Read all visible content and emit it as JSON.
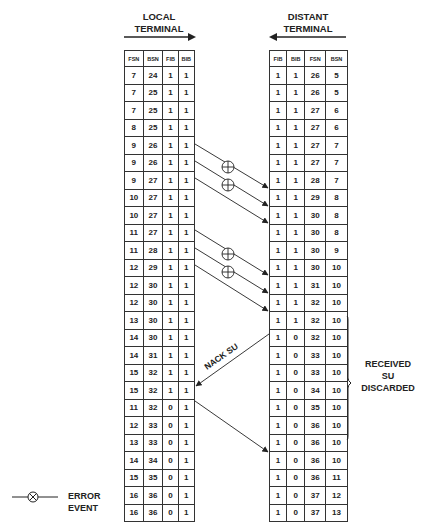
{
  "local_terminal": {
    "title_line1": "LOCAL",
    "title_line2": "TERMINAL",
    "columns": [
      "FSN",
      "BSN",
      "FIB",
      "BIB"
    ],
    "rows": [
      [
        "7",
        "24",
        "1",
        "1"
      ],
      [
        "7",
        "25",
        "1",
        "1"
      ],
      [
        "7",
        "25",
        "1",
        "1"
      ],
      [
        "8",
        "25",
        "1",
        "1"
      ],
      [
        "9",
        "26",
        "1",
        "1"
      ],
      [
        "9",
        "26",
        "1",
        "1"
      ],
      [
        "9",
        "27",
        "1",
        "1"
      ],
      [
        "10",
        "27",
        "1",
        "1"
      ],
      [
        "10",
        "27",
        "1",
        "1"
      ],
      [
        "11",
        "27",
        "1",
        "1"
      ],
      [
        "11",
        "28",
        "1",
        "1"
      ],
      [
        "12",
        "29",
        "1",
        "1"
      ],
      [
        "12",
        "30",
        "1",
        "1"
      ],
      [
        "12",
        "30",
        "1",
        "1"
      ],
      [
        "13",
        "30",
        "1",
        "1"
      ],
      [
        "14",
        "30",
        "1",
        "1"
      ],
      [
        "14",
        "31",
        "1",
        "1"
      ],
      [
        "15",
        "32",
        "1",
        "1"
      ],
      [
        "15",
        "32",
        "1",
        "1"
      ],
      [
        "11",
        "32",
        "0",
        "1"
      ],
      [
        "12",
        "33",
        "0",
        "1"
      ],
      [
        "13",
        "33",
        "0",
        "1"
      ],
      [
        "14",
        "34",
        "0",
        "1"
      ],
      [
        "15",
        "35",
        "0",
        "1"
      ],
      [
        "16",
        "36",
        "0",
        "1"
      ],
      [
        "16",
        "36",
        "0",
        "1"
      ]
    ]
  },
  "distant_terminal": {
    "title_line1": "DISTANT",
    "title_line2": "TERMINAL",
    "columns": [
      "FIB",
      "BIB",
      "FSN",
      "BSN"
    ],
    "rows": [
      [
        "1",
        "1",
        "26",
        "5"
      ],
      [
        "1",
        "1",
        "26",
        "5"
      ],
      [
        "1",
        "1",
        "27",
        "6"
      ],
      [
        "1",
        "1",
        "27",
        "6"
      ],
      [
        "1",
        "1",
        "27",
        "7"
      ],
      [
        "1",
        "1",
        "27",
        "7"
      ],
      [
        "1",
        "1",
        "28",
        "7"
      ],
      [
        "1",
        "1",
        "29",
        "8"
      ],
      [
        "1",
        "1",
        "30",
        "8"
      ],
      [
        "1",
        "1",
        "30",
        "8"
      ],
      [
        "1",
        "1",
        "30",
        "9"
      ],
      [
        "1",
        "1",
        "30",
        "10"
      ],
      [
        "1",
        "1",
        "31",
        "10"
      ],
      [
        "1",
        "1",
        "32",
        "10"
      ],
      [
        "1",
        "1",
        "32",
        "10"
      ],
      [
        "1",
        "0",
        "32",
        "10"
      ],
      [
        "1",
        "0",
        "33",
        "10"
      ],
      [
        "1",
        "0",
        "33",
        "10"
      ],
      [
        "1",
        "0",
        "34",
        "10"
      ],
      [
        "1",
        "0",
        "35",
        "10"
      ],
      [
        "1",
        "0",
        "36",
        "10"
      ],
      [
        "1",
        "0",
        "36",
        "10"
      ],
      [
        "1",
        "0",
        "36",
        "10"
      ],
      [
        "1",
        "0",
        "36",
        "11"
      ],
      [
        "1",
        "0",
        "37",
        "12"
      ],
      [
        "1",
        "0",
        "37",
        "13"
      ]
    ]
  },
  "annotations": {
    "nack_label": "NACK  SU",
    "discarded_line1": "RECEIVED",
    "discarded_line2": "SU",
    "discarded_line3": "DISCARDED"
  },
  "legend": {
    "line1": "ERROR",
    "line2": "EVENT",
    "symbol": "error-event-symbol"
  },
  "colors": {
    "ink": "#222222",
    "background": "#ffffff"
  }
}
